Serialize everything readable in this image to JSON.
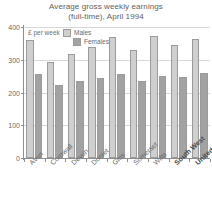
{
  "chart_data": {
    "type": "bar",
    "title": "Average gross weekly earnings (full-time), April 1994",
    "title_line1": "Average gross weekly earnings",
    "title_line2": "(full-time), April 1994",
    "xlabel": "",
    "ylabel": "£ per week",
    "ylim": [
      0,
      400
    ],
    "yticks": [
      0,
      100,
      200,
      300,
      400
    ],
    "grid": true,
    "legend_position": "top-center",
    "categories": [
      "Avon",
      "Cornwall",
      "Devon",
      "Dorset",
      "Glos",
      "Somerset",
      "Wilts",
      "South West",
      "United Kingdom"
    ],
    "categories_bold": [
      "South West",
      "United Kingdom"
    ],
    "series": [
      {
        "name": "Males",
        "color": "#cfcfcf",
        "values": [
          360,
          292,
          317,
          338,
          368,
          329,
          373,
          345,
          362
        ]
      },
      {
        "name": "Females",
        "color": "#a2a2a2",
        "values": [
          256,
          222,
          235,
          243,
          258,
          236,
          251,
          246,
          261
        ]
      }
    ]
  },
  "legend": {
    "items": [
      {
        "label": "Males"
      },
      {
        "label": "Females"
      }
    ]
  },
  "axis": {
    "y_label": "£ per week",
    "ticks": [
      "400",
      "300",
      "200",
      "100",
      "0"
    ]
  },
  "colors": {
    "males": "#cfcfcf",
    "females": "#a2a2a2",
    "axis": "#8e8e8e",
    "grid": "#d8d8d8",
    "text": "#6a6a6a"
  }
}
